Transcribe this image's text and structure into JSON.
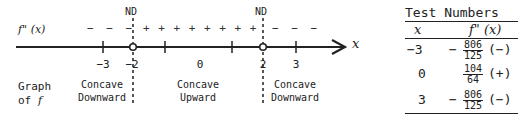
{
  "number_line": {
    "function_label": "f\" (x)",
    "axis_label": "x",
    "nd_label": "ND",
    "sign_intervals": [
      {
        "signs": "− − −",
        "from": "-inf",
        "to": "-2"
      },
      {
        "signs": "+ + + + + + + +",
        "from": "-2",
        "to": "2"
      },
      {
        "signs": "− − −",
        "from": "2",
        "to": "inf"
      }
    ],
    "ticks": [
      "-3",
      "-2",
      "0",
      "2",
      "3"
    ],
    "tick_labels": {
      "t_neg3": "−3",
      "t_neg2": "−2",
      "t_0": "0",
      "t_2": "2",
      "t_3": "3"
    },
    "undefined_points": [
      "-2",
      "2"
    ]
  },
  "graph_label": {
    "line1": "Graph",
    "line2_prefix": "of ",
    "line2_var": "f"
  },
  "regions": [
    {
      "line1": "Concave",
      "line2": "Downward"
    },
    {
      "line1": "Concave",
      "line2": "Upward"
    },
    {
      "line1": "Concave",
      "line2": "Downward"
    }
  ],
  "table": {
    "title": "Test Numbers",
    "headers": {
      "x": "x",
      "fpp": "f\" (x)"
    },
    "rows": [
      {
        "x": "−3",
        "neg": "−",
        "num": "806",
        "den": "125",
        "sign": "(−)"
      },
      {
        "x": "0",
        "neg": "",
        "num": "104",
        "den": "64",
        "sign": "(+)"
      },
      {
        "x": "3",
        "neg": "−",
        "num": "806",
        "den": "125",
        "sign": "(−)"
      }
    ]
  }
}
